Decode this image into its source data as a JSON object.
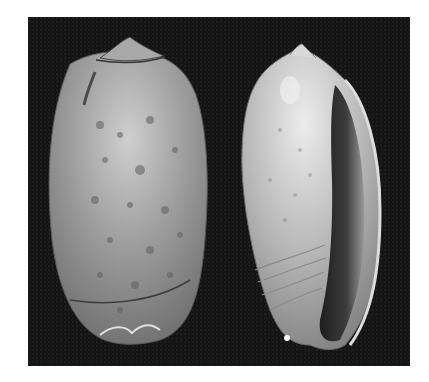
{
  "image": {
    "subject": "Two olive sea shells photographed on a black background",
    "background_color": "#141414",
    "page_color": "#ffffff",
    "shells": [
      {
        "view": "dorsal",
        "position": "left",
        "base_color": "#9a9a9a",
        "highlight_color": "#d0d0d0",
        "spot_color": "#5a5a5a",
        "description": "mottled grey olive shell with dark spots, seen from the back"
      },
      {
        "view": "apertural",
        "position": "right",
        "base_color": "#b8b8b8",
        "highlight_color": "#e6e6e6",
        "aperture_color": "#2a2a2a",
        "description": "pale olive shell showing the long aperture and columellar folds"
      }
    ]
  }
}
